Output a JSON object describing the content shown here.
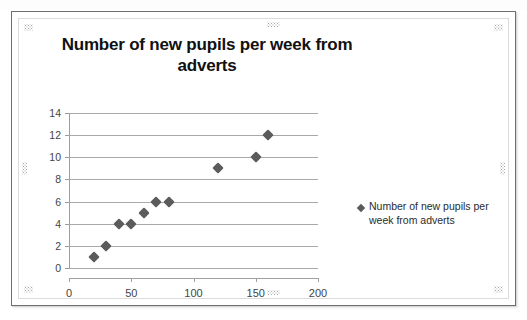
{
  "slide": {
    "object_label": "chart-object"
  },
  "chart_data": {
    "type": "scatter",
    "title": "Number of new pupils per week from adverts",
    "xlabel": "",
    "ylabel": "",
    "xlim": [
      0,
      200
    ],
    "ylim": [
      0,
      14
    ],
    "xticks": [
      "0",
      "50",
      "100",
      "150",
      "200"
    ],
    "yticks": [
      "0",
      "2",
      "4",
      "6",
      "8",
      "10",
      "12",
      "14"
    ],
    "grid": "horizontal",
    "legend_position": "right",
    "series": [
      {
        "name": "Number of new pupils per week from adverts",
        "marker": "diamond",
        "color": "#5b5b5b",
        "points": [
          {
            "x": 20,
            "y": 1
          },
          {
            "x": 30,
            "y": 2
          },
          {
            "x": 40,
            "y": 4
          },
          {
            "x": 50,
            "y": 4
          },
          {
            "x": 60,
            "y": 5
          },
          {
            "x": 70,
            "y": 6
          },
          {
            "x": 80,
            "y": 6
          },
          {
            "x": 120,
            "y": 9
          },
          {
            "x": 150,
            "y": 10
          },
          {
            "x": 160,
            "y": 12
          }
        ]
      }
    ]
  },
  "legend": {
    "entries": [
      {
        "label": "Number of new pupils per week from adverts"
      }
    ]
  }
}
